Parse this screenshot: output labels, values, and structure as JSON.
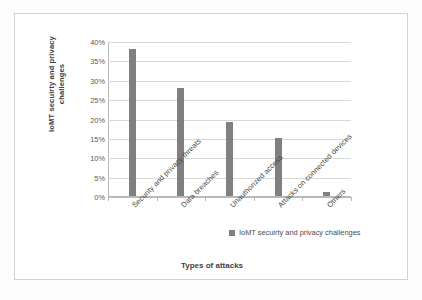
{
  "chart_data": {
    "type": "bar",
    "title": "",
    "categories": [
      "Security and privacy threats",
      "Data breaches",
      "Unauthorized access",
      "Attacks on connected devices",
      "Others"
    ],
    "values": [
      38,
      28,
      19,
      15,
      1
    ],
    "series": [
      {
        "name": "IoMT secuirty and privacy challenges",
        "values": [
          38,
          28,
          19,
          15,
          1
        ]
      }
    ],
    "xlabel": "Types of attacks",
    "ylabel": "IoMT secuirty and privacy challenges",
    "ylim": [
      0,
      40
    ],
    "ytick_labels": [
      "40%",
      "35%",
      "30%",
      "25%",
      "20%",
      "15%",
      "10%",
      "5%",
      "0%"
    ],
    "ytick_values": [
      40,
      35,
      30,
      25,
      20,
      15,
      10,
      5,
      0
    ],
    "grid": true,
    "legend_position": "bottom-right",
    "bar_color": "#808080",
    "gridline_color": "#d9d9d9",
    "axis_color": "#b8b8b8",
    "frame_color": "#d2d2d2",
    "background": "#ffffff"
  },
  "legend": {
    "entries": [
      {
        "label": "IoMT secuirty and privacy challenges",
        "color": "#808080"
      }
    ]
  }
}
